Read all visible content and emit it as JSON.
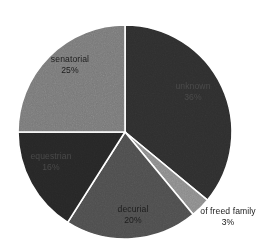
{
  "chart_data": {
    "type": "pie",
    "title": "",
    "subtitle": "",
    "xlabel": "",
    "ylabel": "",
    "legend_position": "none",
    "grid": false,
    "labels_show_percent": true,
    "start_angle_deg": 0,
    "direction": "clockwise",
    "background": "#ffffff",
    "slice_border_color": "#ffffff",
    "categories": [
      "unknown",
      "of freed family",
      "decurial",
      "equestrian",
      "senatorial"
    ],
    "values": [
      36,
      3,
      20,
      16,
      25
    ],
    "units": "%",
    "slices": [
      {
        "name": "unknown",
        "label": "unknown",
        "value": 36,
        "value_text": "36%",
        "color": "#2e2e2e",
        "text_color": "#4a4a4a",
        "label_placement": "inside"
      },
      {
        "name": "of freed family",
        "label": "of freed family",
        "value": 3,
        "value_text": "3%",
        "color": "#8a8a8a",
        "text_color": "#1a1a1a",
        "label_placement": "outside"
      },
      {
        "name": "decurial",
        "label": "decurial",
        "value": 20,
        "value_text": "20%",
        "color": "#4d4d4d",
        "text_color": "#1d1d1d",
        "label_placement": "inside"
      },
      {
        "name": "equestrian",
        "label": "equestrian",
        "value": 16,
        "value_text": "16%",
        "color": "#262626",
        "text_color": "#4a4a4a",
        "label_placement": "inside"
      },
      {
        "name": "senatorial",
        "label": "senatorial",
        "value": 25,
        "value_text": "25%",
        "color": "#787878",
        "text_color": "#1d1d1d",
        "label_placement": "inside"
      }
    ]
  }
}
